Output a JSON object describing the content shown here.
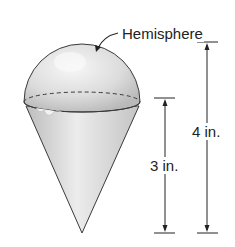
{
  "diagram": {
    "labels": {
      "hemisphere": "Hemisphere",
      "total_height": "4 in.",
      "cone_height": "3 in."
    },
    "colors": {
      "outline": "#3a3a3a",
      "hemisphere_fill": "#d9d9d9",
      "cone_fill": "#cfcfcf",
      "highlight": "#f4f4f4"
    }
  }
}
